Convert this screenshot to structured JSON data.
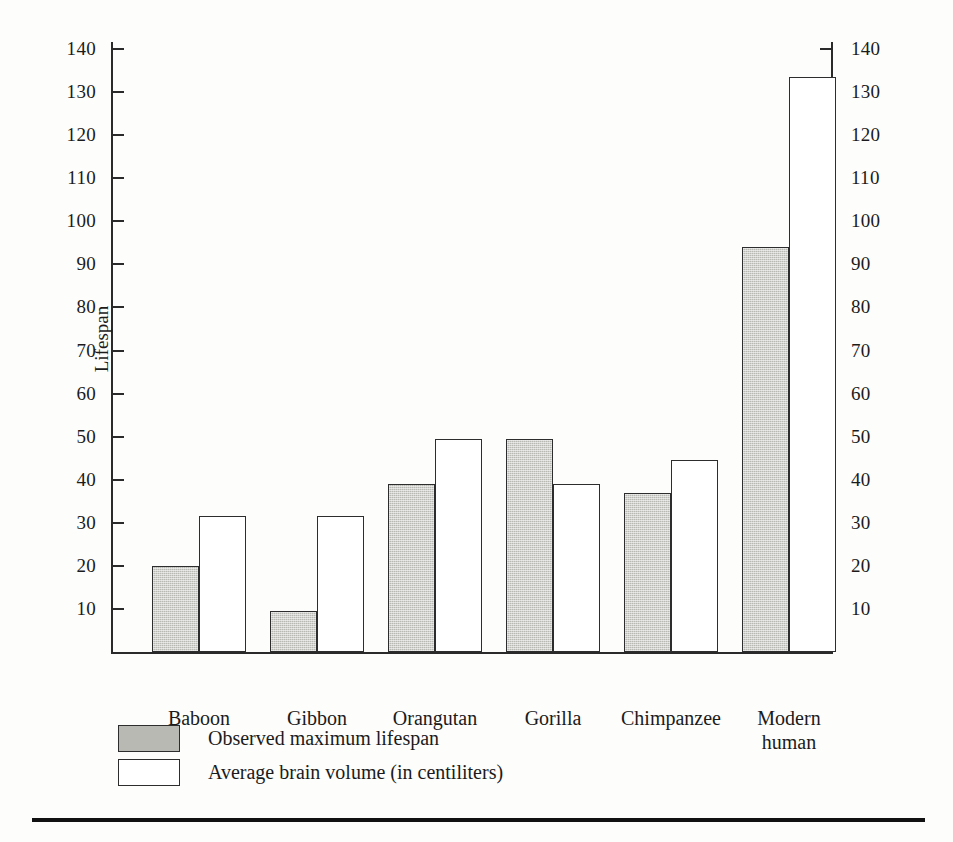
{
  "chart_data": {
    "type": "bar",
    "title": "",
    "subtitle": "",
    "categories": [
      "Baboon",
      "Gibbon",
      "Orangutan",
      "Gorilla",
      "Chimpanzee",
      "Modern\nhuman"
    ],
    "series": [
      {
        "name": "Observed maximum lifespan",
        "axis": "left",
        "color": "#b9b9b4",
        "values": [
          20,
          9.5,
          39,
          49.5,
          37,
          94
        ]
      },
      {
        "name": "Average brain volume (in centiliters)",
        "axis": "right",
        "color": "#ffffff",
        "values": [
          31.5,
          31.5,
          49.5,
          39,
          44.5,
          133.5
        ]
      }
    ],
    "xlabel": "",
    "ylabel": "Lifespan",
    "y2label": "Brain volume (in centiliters)",
    "ylim": [
      0,
      145
    ],
    "y2lim": [
      0,
      145
    ],
    "yticks": [
      10,
      20,
      30,
      40,
      50,
      60,
      70,
      80,
      90,
      100,
      110,
      120,
      130,
      140
    ],
    "y2ticks": [
      10,
      20,
      30,
      40,
      50,
      60,
      70,
      80,
      90,
      100,
      110,
      120,
      130,
      140
    ],
    "grid": false,
    "legend_position": "below-left",
    "legend": [
      "Observed maximum lifespan",
      "Average brain volume (in centiliters)"
    ]
  },
  "axes": {
    "left_title": "Lifespan",
    "right_title": "Brain volume (in centiliters)",
    "tick_labels": [
      "140",
      "130",
      "120",
      "110",
      "100",
      "90",
      "80",
      "70",
      "60",
      "50",
      "40",
      "30",
      "20",
      "10"
    ]
  },
  "legend": {
    "rows": [
      {
        "swatch": "gray-swatch",
        "label": "Observed maximum lifespan"
      },
      {
        "swatch": "white-swatch",
        "label": "Average brain volume (in centiliters)"
      }
    ]
  },
  "colors": {
    "bar_gray": "#b9b9b4",
    "bar_white": "#ffffff",
    "outline": "#2d2d2d",
    "axis": "#2a2a2a",
    "rule": "#111111",
    "page": "#fdfdfc"
  }
}
